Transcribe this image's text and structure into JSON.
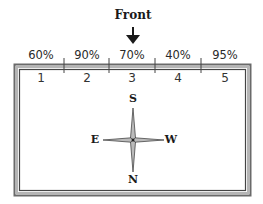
{
  "front": {
    "label": "Front",
    "icon": "arrow-down-icon"
  },
  "zones": [
    {
      "number": "1",
      "percent": "60%"
    },
    {
      "number": "2",
      "percent": "90%"
    },
    {
      "number": "3",
      "percent": "70%"
    },
    {
      "number": "4",
      "percent": "40%"
    },
    {
      "number": "5",
      "percent": "95%"
    }
  ],
  "compass": {
    "top": "S",
    "bottom": "N",
    "left": "E",
    "right": "W",
    "icon": "compass-rose-icon"
  },
  "colors": {
    "line": "#555555",
    "text": "#1a1a1a",
    "background": "#ffffff"
  }
}
